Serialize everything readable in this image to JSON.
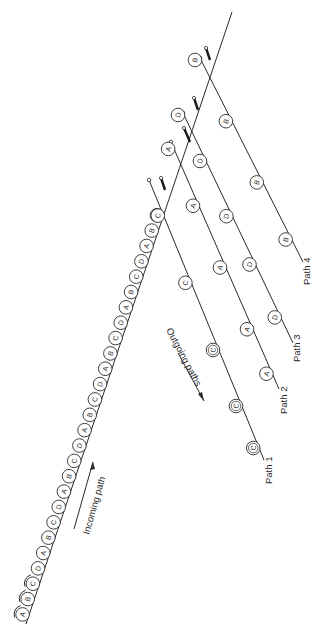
{
  "diagram": {
    "type": "sorting-network",
    "incoming": {
      "label": "Incoming path",
      "sequence": [
        "A",
        "B",
        "C",
        "D",
        "A",
        "B",
        "C",
        "D",
        "A",
        "B",
        "C",
        "D",
        "A",
        "B",
        "C",
        "D",
        "A",
        "B",
        "C",
        "D",
        "A",
        "B",
        "C",
        "D",
        "A",
        "B",
        "D"
      ]
    },
    "outgoing_label": "Outgoing paths",
    "paths": [
      {
        "label": "Path 1",
        "items": [
          "C",
          "C",
          "C",
          "C",
          "C"
        ]
      },
      {
        "label": "Path 2",
        "items": [
          "A",
          "A",
          "A",
          "A",
          "A"
        ]
      },
      {
        "label": "Path 3",
        "items": [
          "D",
          "D",
          "D",
          "D",
          "D"
        ]
      },
      {
        "label": "Path 4",
        "items": [
          "B",
          "B",
          "B",
          "B"
        ]
      }
    ],
    "colors": {
      "line": "#2a2a2a",
      "background": "#ffffff"
    }
  }
}
